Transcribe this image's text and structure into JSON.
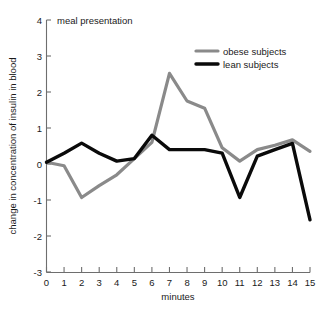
{
  "chart_data": {
    "type": "line",
    "title": "",
    "xlabel": "minutes",
    "ylabel": "change in concentration of insulin in blood",
    "xlim": [
      0,
      15
    ],
    "ylim": [
      -3,
      4
    ],
    "grid": false,
    "legend_position": "top-right",
    "x": [
      0,
      1,
      2,
      3,
      4,
      5,
      6,
      7,
      8,
      9,
      10,
      11,
      12,
      13,
      14,
      15
    ],
    "xticks": [
      "0",
      "1",
      "2",
      "3",
      "4",
      "5",
      "6",
      "7",
      "8",
      "9",
      "10",
      "11",
      "12",
      "13",
      "14",
      "15"
    ],
    "yticks": [
      "4",
      "3",
      "2",
      "1",
      "0",
      "-1",
      "-2",
      "-3"
    ],
    "ytick_values": [
      4,
      3,
      2,
      1,
      0,
      -1,
      -2,
      -3
    ],
    "annotations": [
      {
        "text": "meal presentation",
        "x": 0,
        "y": 4
      }
    ],
    "series": [
      {
        "name": "obese subjects",
        "color": "#8a8a8a",
        "values": [
          0.05,
          -0.05,
          -0.93,
          -0.6,
          -0.3,
          0.15,
          0.6,
          2.52,
          1.75,
          1.55,
          0.45,
          0.08,
          0.4,
          0.52,
          0.67,
          0.35
        ]
      },
      {
        "name": "lean subjects",
        "color": "#0a0a0a",
        "values": [
          0.05,
          0.3,
          0.58,
          0.3,
          0.08,
          0.15,
          0.8,
          0.4,
          0.4,
          0.4,
          0.3,
          -0.93,
          0.22,
          0.4,
          0.57,
          -1.55
        ]
      }
    ]
  },
  "legend": {
    "entries": [
      {
        "label": "obese subjects",
        "color": "#8a8a8a"
      },
      {
        "label": "lean subjects",
        "color": "#0a0a0a"
      }
    ]
  },
  "axes": {
    "x_title": "minutes",
    "y_title": "change in concentration of insulin in blood"
  },
  "annotation": {
    "meal": "meal presentation"
  }
}
